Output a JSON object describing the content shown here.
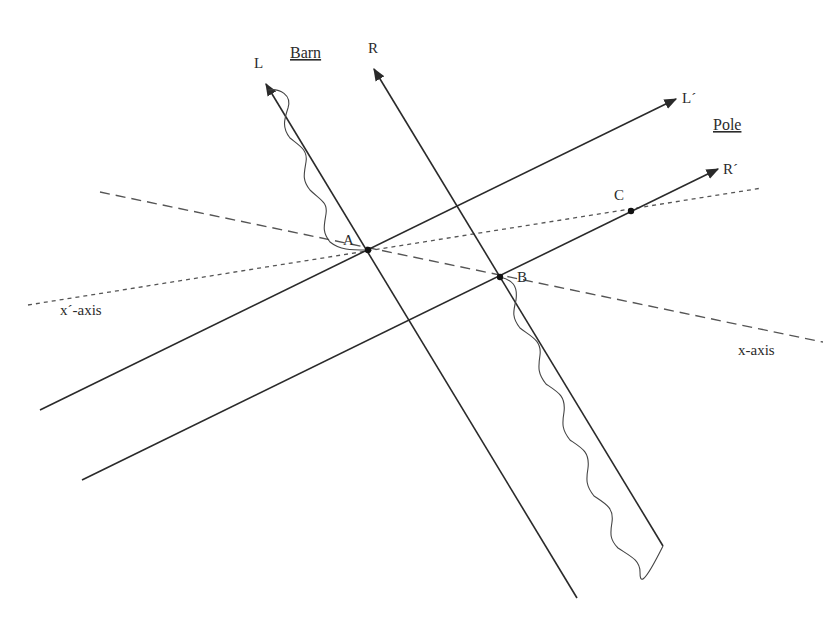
{
  "diagram": {
    "titles": {
      "barn": "Barn",
      "pole": "Pole"
    },
    "worldlines": [
      {
        "id": "L",
        "label": "L",
        "style": "solid-arrow"
      },
      {
        "id": "R",
        "label": "R",
        "style": "solid-arrow"
      },
      {
        "id": "Lp",
        "label": "L´",
        "style": "solid-arrow"
      },
      {
        "id": "Rp",
        "label": "R´",
        "style": "solid-arrow"
      }
    ],
    "axes": [
      {
        "id": "x",
        "label": "x-axis",
        "style": "long-dash"
      },
      {
        "id": "xp",
        "label": "x´-axis",
        "style": "short-dash"
      }
    ],
    "events": [
      {
        "id": "A",
        "label": "A"
      },
      {
        "id": "B",
        "label": "B"
      },
      {
        "id": "C",
        "label": "C"
      }
    ],
    "colors": {
      "line": "#2a2a2a",
      "dashed": "#555555",
      "background": "#ffffff"
    }
  }
}
